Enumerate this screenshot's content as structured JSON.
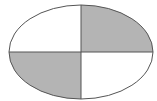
{
  "diagram": {
    "shape": "ellipse",
    "center": {
      "x": 81,
      "y": 52
    },
    "rx": 72,
    "ry": 47,
    "quadrants": [
      {
        "position": "top-left",
        "fill": "#ffffff"
      },
      {
        "position": "top-right",
        "fill": "#b4b4b4"
      },
      {
        "position": "bottom-left",
        "fill": "#b4b4b4"
      },
      {
        "position": "bottom-right",
        "fill": "#ffffff"
      }
    ],
    "stroke_color": "#555555"
  }
}
